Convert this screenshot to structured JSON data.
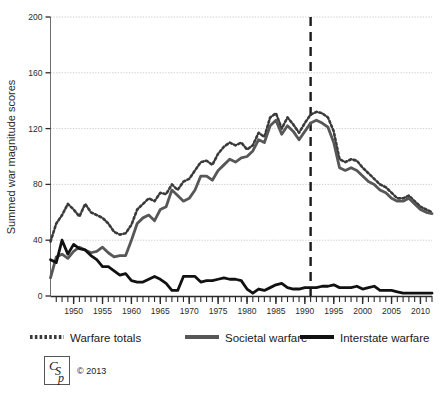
{
  "chart_data": {
    "type": "line",
    "title": "",
    "xlabel": "",
    "ylabel": "Summed war magnitude scores",
    "xlim": [
      1946,
      2012
    ],
    "ylim": [
      0,
      200
    ],
    "grid": true,
    "legend_position": "bottom",
    "ytick_labels": [
      "0",
      "40",
      "80",
      "120",
      "160",
      "200"
    ],
    "ytick_values": [
      0,
      40,
      80,
      120,
      160,
      200
    ],
    "xtick_labels": [
      "1950",
      "1955",
      "1960",
      "1965",
      "1970",
      "1975",
      "1980",
      "1985",
      "1990",
      "1995",
      "2000",
      "2005",
      "2010"
    ],
    "xtick_values": [
      1950,
      1955,
      1960,
      1965,
      1970,
      1975,
      1980,
      1985,
      1990,
      1995,
      2000,
      2005,
      2010
    ],
    "minor_tick_interval": 1,
    "annotations": [
      {
        "name": "cold-war-end-marker",
        "type": "vline",
        "x": 1991,
        "style": "dashed",
        "color": "#1a1a1a"
      }
    ],
    "x": [
      1946,
      1947,
      1948,
      1949,
      1950,
      1951,
      1952,
      1953,
      1954,
      1955,
      1956,
      1957,
      1958,
      1959,
      1960,
      1961,
      1962,
      1963,
      1964,
      1965,
      1966,
      1967,
      1968,
      1969,
      1970,
      1971,
      1972,
      1973,
      1974,
      1975,
      1976,
      1977,
      1978,
      1979,
      1980,
      1981,
      1982,
      1983,
      1984,
      1985,
      1986,
      1987,
      1988,
      1989,
      1990,
      1991,
      1992,
      1993,
      1994,
      1995,
      1996,
      1997,
      1998,
      1999,
      2000,
      2001,
      2002,
      2003,
      2004,
      2005,
      2006,
      2007,
      2008,
      2009,
      2010,
      2011,
      2012
    ],
    "series": [
      {
        "name": "Warfare totals",
        "style": "dotted",
        "color": "#3a3a3a",
        "values": [
          39,
          52,
          58,
          66,
          62,
          57,
          66,
          60,
          58,
          56,
          52,
          46,
          44,
          45,
          51,
          62,
          66,
          70,
          68,
          74,
          73,
          80,
          76,
          82,
          84,
          90,
          96,
          97,
          94,
          102,
          107,
          110,
          108,
          110,
          105,
          108,
          117,
          114,
          128,
          131,
          120,
          128,
          123,
          117,
          124,
          130,
          132,
          131,
          128,
          118,
          98,
          96,
          98,
          97,
          92,
          88,
          84,
          80,
          78,
          74,
          70,
          70,
          72,
          68,
          64,
          62,
          60
        ]
      },
      {
        "name": "Societal warfare",
        "style": "solid",
        "color": "#575757",
        "values": [
          13,
          28,
          30,
          27,
          32,
          35,
          33,
          31,
          32,
          35,
          31,
          28,
          29,
          29,
          40,
          52,
          56,
          58,
          54,
          62,
          64,
          76,
          72,
          68,
          70,
          76,
          86,
          86,
          83,
          90,
          94,
          98,
          96,
          99,
          100,
          104,
          112,
          110,
          122,
          126,
          116,
          122,
          118,
          112,
          118,
          124,
          126,
          124,
          121,
          110,
          92,
          90,
          92,
          90,
          86,
          82,
          80,
          76,
          74,
          70,
          68,
          68,
          70,
          66,
          62,
          60,
          59
        ]
      },
      {
        "name": "Interstate warfare",
        "style": "solid",
        "color": "#111111",
        "values": [
          26,
          24,
          40,
          30,
          37,
          34,
          33,
          29,
          26,
          21,
          21,
          18,
          15,
          16,
          11,
          10,
          10,
          12,
          14,
          12,
          9,
          4,
          4,
          14,
          14,
          14,
          10,
          11,
          11,
          12,
          13,
          12,
          12,
          11,
          5,
          2,
          5,
          4,
          6,
          8,
          9,
          6,
          5,
          5,
          6,
          6,
          6,
          7,
          7,
          8,
          6,
          6,
          6,
          7,
          5,
          6,
          7,
          4,
          4,
          4,
          3,
          2,
          2,
          2,
          2,
          2,
          2
        ]
      }
    ]
  },
  "legend": {
    "items": [
      {
        "label": "Warfare totals",
        "marker": "dotted-line-swatch"
      },
      {
        "label": "Societal warfare",
        "marker": "gray-line-swatch"
      },
      {
        "label": "Interstate warfare",
        "marker": "black-line-swatch"
      }
    ]
  },
  "footer": {
    "logo_text": "CSP",
    "copyright": "© 2013"
  },
  "colors": {
    "warfare_totals": "#3a3a3a",
    "societal_warfare": "#575757",
    "interstate_warfare": "#111111",
    "axis": "#6e6e6e",
    "grid": "#c8c8c8",
    "background": "#ffffff"
  }
}
